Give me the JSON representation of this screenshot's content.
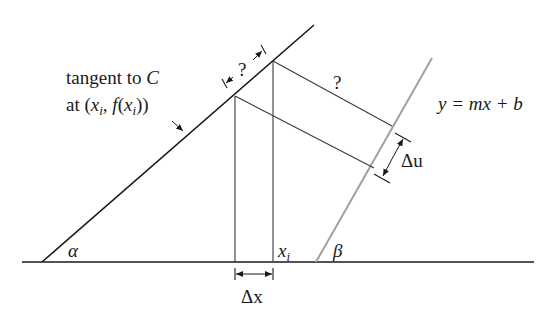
{
  "figure": {
    "background": "#ffffff",
    "line_color": "#1a1a1a",
    "secondary_line_color": "#a0a0a0",
    "labels": {
      "tangent_line1": "tangent to ",
      "tangent_C": "C",
      "tangent_line2_prefix": "at (",
      "tangent_x": "x",
      "tangent_sub_i": "i",
      "tangent_comma": ", ",
      "tangent_f": "f",
      "tangent_paren_open": "(",
      "tangent_x2": "x",
      "tangent_sub_i2": "i",
      "tangent_close": "))",
      "question_top": "?",
      "question_mid": "?",
      "line_equation": "y = mx + b",
      "delta_u": "Δu",
      "delta_x": "Δx",
      "x_i": "x",
      "x_i_sub": "i",
      "alpha": "α",
      "beta": "β"
    }
  }
}
